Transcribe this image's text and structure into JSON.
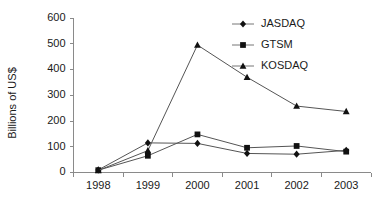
{
  "chart_data": {
    "type": "line",
    "title": "",
    "xlabel": "",
    "ylabel": "Billions of US$",
    "categories": [
      "1998",
      "1999",
      "2000",
      "2001",
      "2002",
      "2003"
    ],
    "x": [
      1998,
      1999,
      2000,
      2001,
      2002,
      2003
    ],
    "ylim": [
      0,
      600
    ],
    "yticks": [
      0,
      100,
      200,
      300,
      400,
      500,
      600
    ],
    "ytick_labels": [
      "0",
      "100",
      "200",
      "300",
      "400",
      "500",
      "600"
    ],
    "grid": false,
    "legend_position": "top-right",
    "series": [
      {
        "name": "JASDAQ",
        "marker": "diamond",
        "color": "#111111",
        "values": [
          10,
          115,
          113,
          74,
          71,
          86
        ]
      },
      {
        "name": "GTSM",
        "marker": "square",
        "color": "#111111",
        "values": [
          9,
          65,
          148,
          96,
          103,
          81
        ]
      },
      {
        "name": "KOSDAQ",
        "marker": "triangle",
        "color": "#111111",
        "values": [
          8,
          85,
          495,
          370,
          258,
          237
        ]
      }
    ]
  },
  "axis": {
    "y_label": "Billions of US$"
  },
  "legend": {
    "entries": [
      {
        "label": "JASDAQ",
        "marker": "diamond"
      },
      {
        "label": "GTSM",
        "marker": "square"
      },
      {
        "label": "KOSDAQ",
        "marker": "triangle"
      }
    ]
  }
}
